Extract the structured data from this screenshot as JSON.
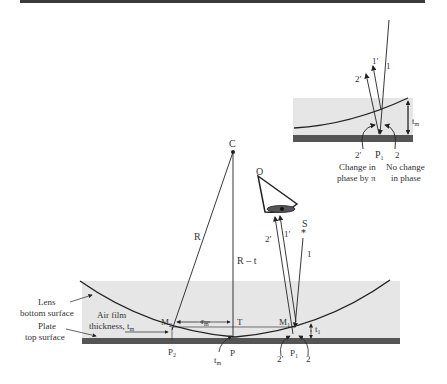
{
  "inset": {
    "rays": {
      "incident": "1",
      "reflected_top": "1′",
      "reflected_bottom": "2′",
      "transmitted_right": "2",
      "reflected_left": "2′"
    },
    "thickness": "t",
    "thickness_sub": "m",
    "point": "P",
    "point_sub": "1",
    "left_note_line1": "Change in",
    "left_note_line2": "phase by π",
    "right_note_line1": "No change",
    "right_note_line2": "in phase"
  },
  "main": {
    "center": "C",
    "radius": "R",
    "radius_minus_t": "R – t",
    "observer": "O",
    "source": "S",
    "ray_incident": "1",
    "ray_1prime": "1′",
    "ray_2prime": "2′",
    "lens_label_line1": "Lens",
    "lens_label_line2": "bottom surface",
    "plate_label_line1": "Plate",
    "plate_label_line2": "top surface",
    "air_label_line1": "Air film",
    "air_label_line2": "thickness, t",
    "air_label_sub": "m",
    "M2": "M",
    "M2_sub": "2",
    "M1": "M",
    "M1_sub": "1",
    "r": "r",
    "r_sub": "m",
    "T": "T",
    "P": "P",
    "P1": "P",
    "P1_sub": "1",
    "P2": "P",
    "P2_sub": "2",
    "t_bottom": "t",
    "t_bottom_sub": "m",
    "t1": "t",
    "t1_sub": "1",
    "ray_bottom_2prime": "2′",
    "ray_bottom_2": "2"
  },
  "colors": {
    "top_bar": "#3a3a3a",
    "glass": "#e6e6e6",
    "plate": "#555555",
    "line": "#222222"
  }
}
